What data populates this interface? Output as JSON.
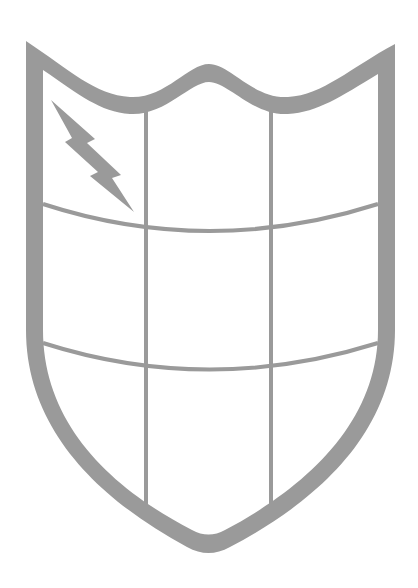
{
  "illustration": {
    "subject": "shield with grid and lightning bolt",
    "colors": {
      "stroke": "#9a9a9a",
      "fill": "#ffffff",
      "background": "#ffffff"
    },
    "grid": {
      "columns": 3,
      "rows": 3
    },
    "icons": [
      "shield-icon",
      "lightning-bolt-icon"
    ]
  }
}
